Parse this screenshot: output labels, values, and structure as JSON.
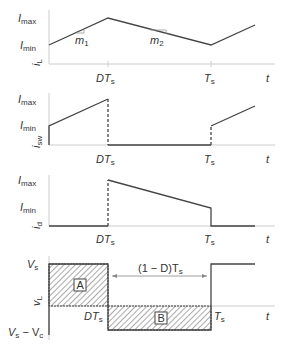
{
  "panels": [
    {
      "id": "iL",
      "ylabel": "i",
      "ylabel_sub": "L",
      "levels": {
        "max": "I",
        "max_sub": "max",
        "min": "I",
        "min_sub": "min"
      },
      "slopes": [
        {
          "label": "m",
          "sub": "1"
        },
        {
          "label": "m",
          "sub": "2"
        }
      ]
    },
    {
      "id": "isw",
      "ylabel": "i",
      "ylabel_sub": "sw",
      "levels": {
        "max": "I",
        "max_sub": "max",
        "min": "I",
        "min_sub": "min"
      }
    },
    {
      "id": "id",
      "ylabel": "i",
      "ylabel_sub": "d",
      "levels": {
        "max": "I",
        "max_sub": "max",
        "min": "I",
        "min_sub": "min"
      }
    },
    {
      "id": "vL",
      "ylabel": "v",
      "ylabel_sub": "L",
      "levels": {
        "top": "V",
        "top_sub": "s",
        "bottom": "V",
        "bottom_sub": "s",
        "bottom_minus": " − V",
        "bottom_sub2": "c"
      },
      "areas": [
        "A",
        "B"
      ],
      "interval_label": "(1 − D)T",
      "interval_sub": "s"
    }
  ],
  "xaxis": {
    "dt": "DT",
    "dt_sub": "s",
    "ts": "T",
    "ts_sub": "s",
    "t": "t"
  }
}
